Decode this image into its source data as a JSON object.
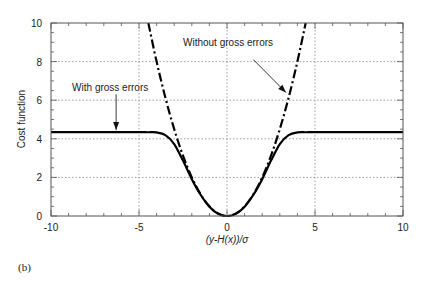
{
  "chart_data": {
    "type": "line",
    "title": "",
    "panel_label": "(b)",
    "xlabel": "(y-H(x))/σ",
    "xlabel_parts": [
      "(y-",
      "H",
      "(",
      "x",
      "))/σ"
    ],
    "ylabel": "Cost function",
    "xlim": [
      -10,
      10
    ],
    "ylim": [
      0,
      10
    ],
    "xticks": [
      -10,
      -5,
      0,
      5,
      10
    ],
    "xtick_labels": [
      "-10",
      "-5",
      "0",
      "5",
      "10"
    ],
    "yticks": [
      0,
      2,
      4,
      6,
      8,
      10
    ],
    "ytick_labels": [
      "0",
      "2",
      "4",
      "6",
      "8",
      "10"
    ],
    "x_minor_step": 1,
    "y_minor_step": 0.5,
    "grid": {
      "on": true,
      "style": "dotted",
      "x": [
        -5,
        0,
        5
      ],
      "y": [
        2,
        4,
        6,
        8
      ]
    },
    "legend": null,
    "series": [
      {
        "name": "With gross errors",
        "style": "solid",
        "color": "#000000",
        "x": [
          -10,
          -6,
          -5,
          -4.5,
          -4,
          -3.5,
          -3,
          -2.5,
          -2,
          -1.5,
          -1,
          -0.5,
          0,
          0.5,
          1,
          1.5,
          2,
          2.5,
          3,
          3.5,
          4,
          4.5,
          5,
          6,
          10
        ],
        "y": [
          4.35,
          4.35,
          4.35,
          4.34,
          4.33,
          4.19,
          3.73,
          2.87,
          1.91,
          1.1,
          0.48,
          0.11,
          0.0,
          0.11,
          0.48,
          1.1,
          1.91,
          2.87,
          3.73,
          4.19,
          4.33,
          4.34,
          4.35,
          4.35,
          4.35
        ]
      },
      {
        "name": "Without gross errors",
        "style": "dashdot",
        "color": "#000000",
        "x": [
          -4.47,
          -4,
          -3.5,
          -3,
          -2.5,
          -2,
          -1.5,
          -1,
          -0.5,
          0,
          0.5,
          1,
          1.5,
          2,
          2.5,
          3,
          3.5,
          4,
          4.47
        ],
        "y": [
          10.0,
          8.0,
          6.125,
          4.5,
          3.125,
          2.0,
          1.125,
          0.5,
          0.125,
          0.0,
          0.125,
          0.5,
          1.125,
          2.0,
          3.125,
          4.5,
          6.125,
          8.0,
          10.0
        ]
      }
    ],
    "annotations": [
      {
        "text": "With gross errors",
        "text_x": -8.8,
        "text_y": 6.5,
        "arrow_from": [
          -6.3,
          6.3
        ],
        "arrow_to": [
          -6.3,
          4.45
        ]
      },
      {
        "text": "Without gross errors",
        "text_x": -2.5,
        "text_y": 8.8,
        "arrow_from": [
          1.5,
          8.1
        ],
        "arrow_to": [
          3.35,
          6.4
        ]
      }
    ]
  }
}
